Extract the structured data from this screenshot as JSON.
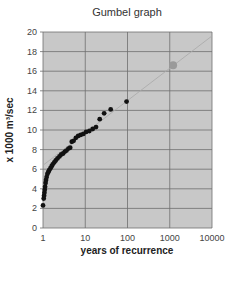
{
  "chart_data": {
    "type": "scatter",
    "title": "Gumbel graph",
    "xlabel": "years of recurrence",
    "ylabel": "x 1000 m³/sec",
    "xscale": "log",
    "xlim": [
      1,
      10000
    ],
    "ylim": [
      0,
      20
    ],
    "xticks": [
      "1",
      "10",
      "100",
      "1000",
      "10000"
    ],
    "yticks": [
      "0",
      "2",
      "4",
      "6",
      "8",
      "10",
      "12",
      "14",
      "16",
      "18",
      "20"
    ],
    "grid": true,
    "legend": null,
    "colors": {
      "plot_bg": "#c8c8c8",
      "grid": "#6e6e6e",
      "points": "#111111",
      "projected_point": "#9a9a9a",
      "trend": "#a8a8a8"
    },
    "series": [
      {
        "name": "observed",
        "x": [
          1.0,
          1.04,
          1.06,
          1.08,
          1.1,
          1.12,
          1.15,
          1.18,
          1.22,
          1.27,
          1.33,
          1.4,
          1.5,
          1.6,
          1.7,
          1.85,
          2.0,
          2.2,
          2.45,
          2.7,
          3.0,
          3.3,
          3.6,
          4.0,
          4.4,
          4.8,
          5.3,
          6.0,
          6.8,
          7.8,
          9.0,
          10.5,
          12.5,
          15,
          18,
          22,
          28,
          40,
          95
        ],
        "y": [
          2.3,
          3.0,
          3.3,
          3.6,
          3.9,
          4.2,
          4.6,
          4.9,
          5.2,
          5.5,
          5.7,
          5.9,
          6.1,
          6.3,
          6.5,
          6.7,
          6.9,
          7.1,
          7.3,
          7.5,
          7.6,
          7.8,
          7.9,
          8.1,
          8.2,
          8.8,
          8.9,
          9.2,
          9.4,
          9.5,
          9.6,
          9.8,
          9.9,
          10.1,
          10.3,
          11.1,
          11.7,
          12.1,
          12.9
        ]
      },
      {
        "name": "projected",
        "x": [
          1200
        ],
        "y": [
          16.6
        ]
      },
      {
        "name": "trend",
        "type": "line",
        "x": [
          1,
          10000
        ],
        "y": [
          6.4,
          19.6
        ]
      }
    ]
  }
}
